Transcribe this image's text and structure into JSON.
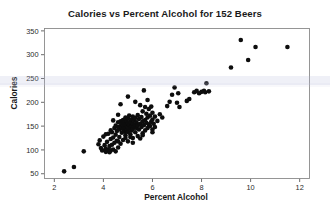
{
  "chart_data": {
    "type": "scatter",
    "title": "Calories vs Percent Alcohol for 152 Beers",
    "xlabel": "Percent Alcohol",
    "ylabel": "Calories",
    "xlim": [
      1.6,
      12.4
    ],
    "ylim": [
      40,
      355
    ],
    "xticks": [
      2,
      4,
      6,
      8,
      10,
      12
    ],
    "yticks": [
      50,
      100,
      150,
      200,
      250,
      300,
      350
    ],
    "xtick_labels": [
      "2",
      "4",
      "6",
      "8",
      "10",
      "12"
    ],
    "ytick_labels": [
      "50",
      "100",
      "150",
      "200",
      "250",
      "300",
      "350"
    ],
    "grid": false,
    "legend": null,
    "n_points": 152,
    "marker_color": "#0d0d0d",
    "marker_size": 2.3,
    "points": [
      [
        2.4,
        55
      ],
      [
        2.8,
        64
      ],
      [
        3.2,
        97
      ],
      [
        3.8,
        112
      ],
      [
        3.85,
        120
      ],
      [
        3.9,
        104
      ],
      [
        3.95,
        99
      ],
      [
        4.0,
        128
      ],
      [
        4.05,
        110
      ],
      [
        4.1,
        96
      ],
      [
        4.1,
        103
      ],
      [
        4.15,
        117
      ],
      [
        4.2,
        100
      ],
      [
        4.2,
        134
      ],
      [
        4.25,
        108
      ],
      [
        4.25,
        95
      ],
      [
        4.3,
        123
      ],
      [
        4.3,
        99
      ],
      [
        4.35,
        111
      ],
      [
        4.35,
        137
      ],
      [
        4.4,
        101
      ],
      [
        4.4,
        126
      ],
      [
        4.45,
        115
      ],
      [
        4.45,
        146
      ],
      [
        4.5,
        97
      ],
      [
        4.5,
        132
      ],
      [
        4.5,
        151
      ],
      [
        4.55,
        119
      ],
      [
        4.55,
        140
      ],
      [
        4.6,
        105
      ],
      [
        4.6,
        148
      ],
      [
        4.6,
        158
      ],
      [
        4.65,
        127
      ],
      [
        4.65,
        143
      ],
      [
        4.7,
        113
      ],
      [
        4.7,
        150
      ],
      [
        4.7,
        160
      ],
      [
        4.75,
        136
      ],
      [
        4.75,
        147
      ],
      [
        4.75,
        155
      ],
      [
        4.8,
        121
      ],
      [
        4.8,
        144
      ],
      [
        4.8,
        152
      ],
      [
        4.8,
        163
      ],
      [
        4.85,
        139
      ],
      [
        4.85,
        149
      ],
      [
        4.85,
        157
      ],
      [
        4.9,
        131
      ],
      [
        4.9,
        146
      ],
      [
        4.9,
        154
      ],
      [
        4.9,
        168
      ],
      [
        4.95,
        142
      ],
      [
        4.95,
        151
      ],
      [
        4.95,
        161
      ],
      [
        5.0,
        118
      ],
      [
        5.0,
        138
      ],
      [
        5.0,
        148
      ],
      [
        5.0,
        156
      ],
      [
        5.0,
        166
      ],
      [
        5.05,
        145
      ],
      [
        5.05,
        153
      ],
      [
        5.05,
        172
      ],
      [
        5.1,
        133
      ],
      [
        5.1,
        147
      ],
      [
        5.1,
        159
      ],
      [
        5.15,
        141
      ],
      [
        5.15,
        150
      ],
      [
        5.15,
        164
      ],
      [
        5.2,
        125
      ],
      [
        5.2,
        144
      ],
      [
        5.2,
        155
      ],
      [
        5.2,
        170
      ],
      [
        5.25,
        149
      ],
      [
        5.25,
        162
      ],
      [
        5.3,
        137
      ],
      [
        5.3,
        152
      ],
      [
        5.3,
        167
      ],
      [
        5.35,
        146
      ],
      [
        5.35,
        158
      ],
      [
        5.4,
        129
      ],
      [
        5.4,
        151
      ],
      [
        5.4,
        173
      ],
      [
        5.45,
        143
      ],
      [
        5.45,
        165
      ],
      [
        5.5,
        124
      ],
      [
        5.5,
        155
      ],
      [
        5.5,
        194
      ],
      [
        5.55,
        148
      ],
      [
        5.55,
        169
      ],
      [
        5.6,
        135
      ],
      [
        5.6,
        160
      ],
      [
        5.6,
        181
      ],
      [
        5.65,
        152
      ],
      [
        5.65,
        225
      ],
      [
        5.7,
        141
      ],
      [
        5.7,
        163
      ],
      [
        5.7,
        190
      ],
      [
        5.75,
        157
      ],
      [
        5.75,
        176
      ],
      [
        5.8,
        146
      ],
      [
        5.8,
        168
      ],
      [
        5.8,
        205
      ],
      [
        5.85,
        154
      ],
      [
        5.85,
        186
      ],
      [
        5.9,
        150
      ],
      [
        5.9,
        172
      ],
      [
        5.95,
        159
      ],
      [
        5.95,
        191
      ],
      [
        6.0,
        143
      ],
      [
        6.0,
        164
      ],
      [
        6.0,
        178
      ],
      [
        6.05,
        155
      ],
      [
        6.1,
        148
      ],
      [
        6.1,
        170
      ],
      [
        6.2,
        161
      ],
      [
        6.3,
        175
      ],
      [
        6.4,
        168
      ],
      [
        4.7,
        196
      ],
      [
        5.0,
        212
      ],
      [
        5.3,
        201
      ],
      [
        4.1,
        133
      ],
      [
        4.3,
        141
      ],
      [
        4.6,
        118
      ],
      [
        4.9,
        125
      ],
      [
        5.2,
        115
      ],
      [
        6.6,
        192
      ],
      [
        6.7,
        201
      ],
      [
        6.8,
        216
      ],
      [
        6.9,
        231
      ],
      [
        7.0,
        199
      ],
      [
        7.05,
        219
      ],
      [
        7.1,
        190
      ],
      [
        7.4,
        203
      ],
      [
        7.5,
        207
      ],
      [
        7.7,
        221
      ],
      [
        7.8,
        224
      ],
      [
        7.9,
        219
      ],
      [
        8.0,
        222
      ],
      [
        8.1,
        224
      ],
      [
        8.15,
        221
      ],
      [
        8.2,
        240
      ],
      [
        8.3,
        223
      ],
      [
        9.2,
        273
      ],
      [
        9.6,
        331
      ],
      [
        9.9,
        289
      ],
      [
        10.2,
        316
      ],
      [
        11.5,
        316
      ],
      [
        4.4,
        162
      ],
      [
        4.6,
        174
      ],
      [
        5.1,
        127
      ],
      [
        5.6,
        131
      ],
      [
        6.0,
        137
      ]
    ]
  }
}
